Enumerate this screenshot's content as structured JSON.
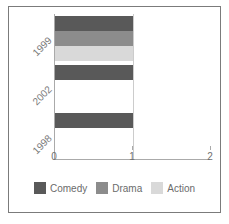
{
  "chart_data": {
    "type": "bar",
    "orientation": "horizontal",
    "stacked": true,
    "title": "",
    "xlabel": "",
    "ylabel": "",
    "categories": [
      "1999",
      "2002",
      "1998"
    ],
    "xlim": [
      0,
      2
    ],
    "xticks": [
      0,
      1,
      2
    ],
    "xtick_labels": [
      "0",
      "1",
      "2"
    ],
    "grid": true,
    "legend_position": "bottom",
    "series": [
      {
        "name": "Comedy",
        "color": "#595959",
        "values": [
          1,
          1,
          1
        ]
      },
      {
        "name": "Drama",
        "color": "#8c8c8c",
        "values": [
          1,
          0,
          0
        ]
      },
      {
        "name": "Action",
        "color": "#d9d9d9",
        "values": [
          1,
          0,
          0
        ]
      }
    ],
    "bars": [
      {
        "category": "1999",
        "segments": [
          {
            "series": "Comedy",
            "value": 1,
            "color": "#595959"
          },
          {
            "series": "Drama",
            "value": 1,
            "color": "#8c8c8c"
          },
          {
            "series": "Action",
            "value": 1,
            "color": "#d9d9d9"
          }
        ]
      },
      {
        "category": "2002",
        "segments": [
          {
            "series": "Comedy",
            "value": 1,
            "color": "#595959"
          }
        ]
      },
      {
        "category": "1998",
        "segments": [
          {
            "series": "Comedy",
            "value": 1,
            "color": "#595959"
          }
        ]
      }
    ]
  },
  "axis": {
    "x": {
      "tick_labels": [
        "0",
        "1",
        "2"
      ]
    },
    "y": {
      "tick_labels": [
        "1999",
        "2002",
        "1998"
      ]
    }
  },
  "legend": {
    "items": [
      {
        "label": "Comedy",
        "color": "#595959"
      },
      {
        "label": "Drama",
        "color": "#8c8c8c"
      },
      {
        "label": "Action",
        "color": "#d9d9d9"
      }
    ]
  },
  "style": {
    "border_color": "#7b7b7b",
    "axis_color": "#aaaaaa",
    "grid_color": "#cccccc",
    "text_color": "#6f6f6f",
    "background": "#ffffff"
  }
}
